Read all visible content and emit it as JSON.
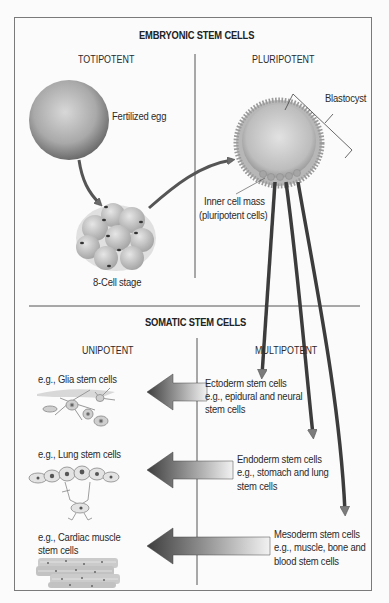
{
  "embryonic": {
    "title": "EMBRYONIC STEM CELLS",
    "left_column": "TOTIPOTENT",
    "right_column": "PLURIPOTENT",
    "labels": {
      "fertilized_egg": "Fertilized egg",
      "eight_cell": "8-Cell stage",
      "blastocyst": "Blastocyst",
      "inner_cell_mass_1": "Inner cell mass",
      "inner_cell_mass_2": "(pluripotent cells)"
    }
  },
  "somatic": {
    "title": "SOMATIC STEM CELLS",
    "left_column": "UNIPOTENT",
    "right_column": "MULTIPOTENT",
    "unipotent": [
      {
        "lines": [
          "e.g., Glia stem cells"
        ]
      },
      {
        "lines": [
          "e.g., Lung stem cells"
        ]
      },
      {
        "lines": [
          "e.g., Cardiac muscle",
          "stem cells"
        ]
      }
    ],
    "multipotent": [
      {
        "lines": [
          "Ectoderm stem cells",
          "e.g., epidural and neural",
          "stem cells"
        ]
      },
      {
        "lines": [
          "Endoderm stem cells",
          "e.g., stomach and lung",
          "stem cells"
        ]
      },
      {
        "lines": [
          "Mesoderm stem cells",
          "e.g., muscle, bone and",
          "blood stem cells"
        ]
      }
    ]
  },
  "colors": {
    "frame": "#7a7a7a",
    "divider": "#555555",
    "arrow_dark": "#4a4a4a",
    "arrow_light": "#f0f0f0",
    "cell_gray": "#b5b5b5"
  }
}
